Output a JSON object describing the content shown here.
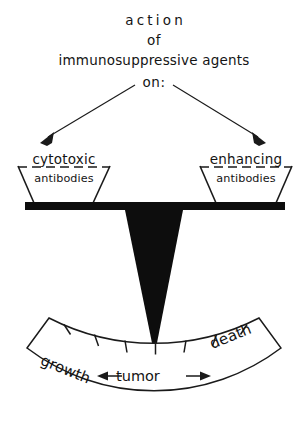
{
  "figure": {
    "kind": "balance-scale-diagram",
    "background_color": "#ffffff",
    "ink_color": "#111111"
  },
  "title": {
    "line1": "action",
    "line2": "of",
    "line3": "immunosuppressive agents",
    "line4": "on:"
  },
  "arrows": {
    "left_target": "cytotoxic antibodies pan",
    "right_target": "enhancing antibodies pan"
  },
  "pans": {
    "left": {
      "label": "cytotoxic",
      "contents": "antibodies"
    },
    "right": {
      "label": "enhancing",
      "contents": "antibodies"
    }
  },
  "scale": {
    "beam": "balance-beam",
    "needle": "pointer-needle",
    "needle_position": "center"
  },
  "gauge": {
    "left_word": "growth",
    "center_word": "tumor",
    "right_word": "death",
    "left_arrow": "←",
    "right_arrow": "→",
    "tick_count": 7
  }
}
